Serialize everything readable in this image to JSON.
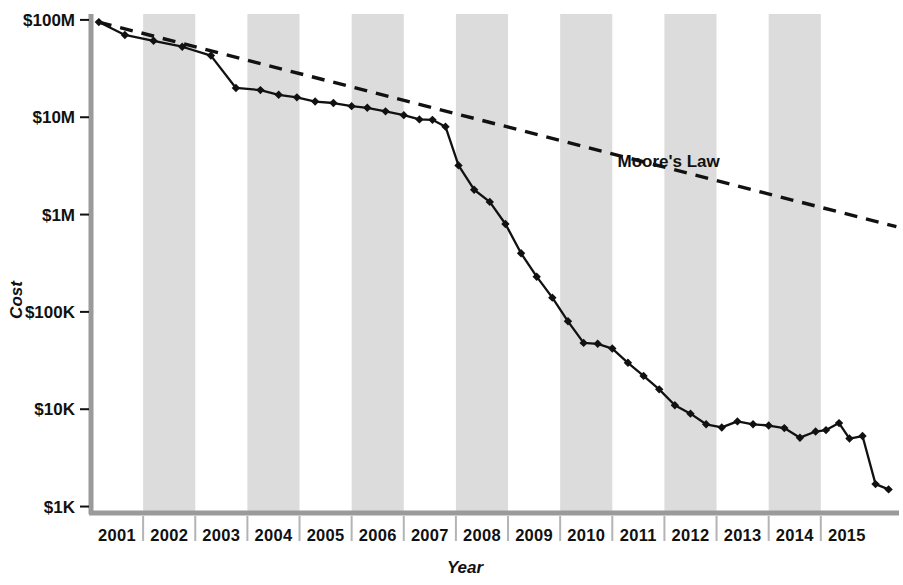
{
  "chart_data": {
    "type": "line",
    "title": "",
    "xlabel": "Year",
    "ylabel": "Cost",
    "log_y": true,
    "ylim": [
      1000,
      100000000
    ],
    "xlim": [
      2001.0,
      2015.75
    ],
    "grid": false,
    "legend_position": "inline-annotation",
    "y_tick_labels": [
      "$100M",
      "$10M",
      "$1M",
      "$100K",
      "$10K",
      "$1K"
    ],
    "y_tick_values": [
      100000000,
      10000000,
      1000000,
      100000,
      10000,
      1000
    ],
    "x_tick_labels": [
      "2001",
      "2002",
      "2003",
      "2004",
      "2005",
      "2006",
      "2007",
      "2008",
      "2009",
      "2010",
      "2011",
      "2012",
      "2013",
      "2014",
      "2015"
    ],
    "x_tick_values": [
      2001,
      2002,
      2003,
      2004,
      2005,
      2006,
      2007,
      2008,
      2009,
      2010,
      2011,
      2012,
      2013,
      2014,
      2015
    ],
    "shaded_band_years": [
      2002,
      2004,
      2006,
      2008,
      2010,
      2012,
      2014
    ],
    "annotations": [
      {
        "text": "Moore's Law",
        "x": 2011.1,
        "y": 3100000
      }
    ],
    "series": [
      {
        "name": "Cost per Genome",
        "style": "solid",
        "marker": "diamond",
        "color": "#111111",
        "points": [
          {
            "x": 2001.15,
            "y": 95000000
          },
          {
            "x": 2001.65,
            "y": 70000000
          },
          {
            "x": 2002.2,
            "y": 61000000
          },
          {
            "x": 2002.75,
            "y": 53000000
          },
          {
            "x": 2003.3,
            "y": 43000000
          },
          {
            "x": 2003.78,
            "y": 20000000
          },
          {
            "x": 2004.25,
            "y": 19000000
          },
          {
            "x": 2004.6,
            "y": 17000000
          },
          {
            "x": 2004.95,
            "y": 16000000
          },
          {
            "x": 2005.3,
            "y": 14500000
          },
          {
            "x": 2005.65,
            "y": 14000000
          },
          {
            "x": 2006.0,
            "y": 13000000
          },
          {
            "x": 2006.3,
            "y": 12500000
          },
          {
            "x": 2006.65,
            "y": 11500000
          },
          {
            "x": 2007.0,
            "y": 10500000
          },
          {
            "x": 2007.3,
            "y": 9500000
          },
          {
            "x": 2007.55,
            "y": 9400000
          },
          {
            "x": 2007.8,
            "y": 8000000
          },
          {
            "x": 2008.05,
            "y": 3200000
          },
          {
            "x": 2008.35,
            "y": 1800000
          },
          {
            "x": 2008.65,
            "y": 1350000
          },
          {
            "x": 2008.95,
            "y": 800000
          },
          {
            "x": 2009.25,
            "y": 400000
          },
          {
            "x": 2009.55,
            "y": 230000
          },
          {
            "x": 2009.85,
            "y": 140000
          },
          {
            "x": 2010.15,
            "y": 80000
          },
          {
            "x": 2010.45,
            "y": 48000
          },
          {
            "x": 2010.72,
            "y": 47000
          },
          {
            "x": 2011.0,
            "y": 42000
          },
          {
            "x": 2011.3,
            "y": 30000
          },
          {
            "x": 2011.6,
            "y": 22000
          },
          {
            "x": 2011.9,
            "y": 16000
          },
          {
            "x": 2012.2,
            "y": 11000
          },
          {
            "x": 2012.5,
            "y": 9000
          },
          {
            "x": 2012.8,
            "y": 7000
          },
          {
            "x": 2013.1,
            "y": 6500
          },
          {
            "x": 2013.4,
            "y": 7500
          },
          {
            "x": 2013.7,
            "y": 7000
          },
          {
            "x": 2014.0,
            "y": 6800
          },
          {
            "x": 2014.3,
            "y": 6400
          },
          {
            "x": 2014.6,
            "y": 5100
          },
          {
            "x": 2014.9,
            "y": 5900
          },
          {
            "x": 2015.1,
            "y": 6100
          },
          {
            "x": 2015.35,
            "y": 7200
          },
          {
            "x": 2015.55,
            "y": 5000
          },
          {
            "x": 2015.8,
            "y": 5300
          },
          {
            "x": 2016.05,
            "y": 1700
          },
          {
            "x": 2016.3,
            "y": 1500
          }
        ]
      },
      {
        "name": "Moore's Law",
        "style": "dashed",
        "marker": "none",
        "color": "#111111",
        "points": [
          {
            "x": 2001.15,
            "y": 95000000
          },
          {
            "x": 2016.45,
            "y": 750000
          }
        ]
      }
    ]
  },
  "colors": {
    "background": "#ffffff",
    "band": "#dcdcdc",
    "axis": "#9a9a9a",
    "ink": "#111111"
  }
}
